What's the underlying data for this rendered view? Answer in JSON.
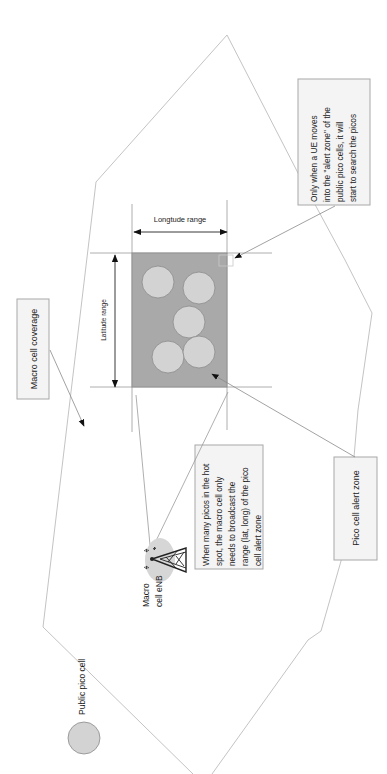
{
  "diagram": {
    "orientation": "rotated-90-ccw",
    "legend": {
      "label": "Public pico cell",
      "icon": "grey-circle-icon"
    },
    "macro_cell_label": "Macro cell coverage",
    "macro_enb_label_line1": "Macro",
    "macro_enb_label_line2": "cell eNB",
    "alert_zone": {
      "longitude_label": "Longtude range",
      "latitude_label": "Latitude range",
      "pico_count": 5
    },
    "callouts": {
      "ue_note": [
        "Only when a UE moves",
        "into the \"alert zone\" of the",
        "public pico cells, it will",
        "start to search the picos"
      ],
      "broadcast_note": [
        "When many picos in the hot",
        "spot, the macro cell only",
        "needs to broadcast the",
        "range (lat, long) of the pico",
        "cell alert zone"
      ],
      "pico_alert_zone": "Pico cell alert zone"
    },
    "colors": {
      "zone_fill": "#a9a9a9",
      "pico_fill": "#d3d3d3",
      "box_fill": "#f4f4f4",
      "line": "#b4b4b4"
    }
  }
}
